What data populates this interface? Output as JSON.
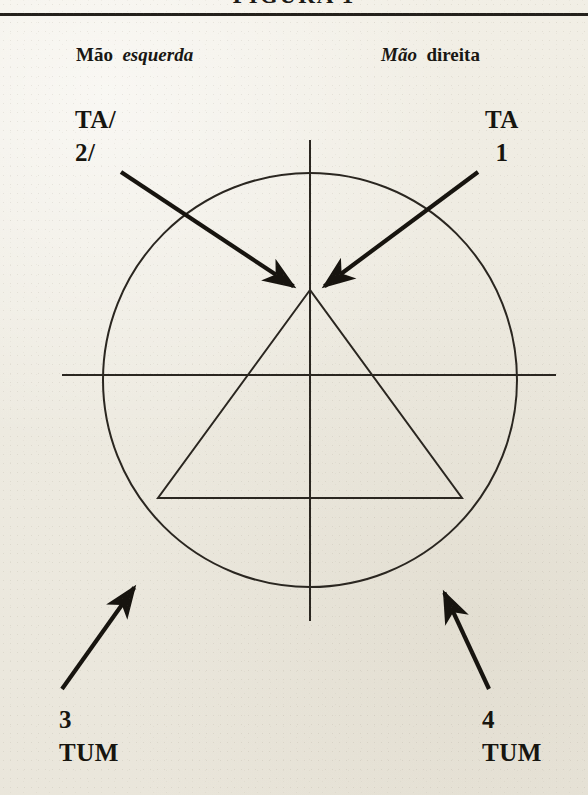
{
  "page": {
    "background_color": "#efece2",
    "ink_color": "#1b1812",
    "cut_off_title": "FIGURA 1"
  },
  "header": {
    "left_hand_label": {
      "word_upright": "Mão",
      "word_italic": "esquerda"
    },
    "right_hand_label": {
      "word_italic": "Mão",
      "word_upright": "direita"
    }
  },
  "annotations": [
    {
      "id": "ta-2",
      "line1": "TA/",
      "line2": "2/",
      "position": "top-left"
    },
    {
      "id": "ta-1",
      "line1": "TA",
      "line2": "1",
      "position": "top-right"
    },
    {
      "id": "tum-3",
      "line1": "3",
      "line2": "TUM",
      "position": "bottom-left"
    },
    {
      "id": "tum-4",
      "line1": "4",
      "line2": "TUM",
      "position": "bottom-right"
    }
  ],
  "figure": {
    "type": "geometric-diagram",
    "circle": {
      "cx": 310,
      "cy": 380,
      "r": 207,
      "stroke_width": 2
    },
    "vertical_axis": {
      "x": 310,
      "y1": 140,
      "y2": 621,
      "stroke_width": 2
    },
    "horizontal_axis": {
      "y": 375,
      "x1": 62,
      "x2": 556,
      "stroke_width": 2
    },
    "triangle": {
      "apex": [
        310,
        290
      ],
      "base_left": [
        158,
        498
      ],
      "base_right": [
        462,
        498
      ],
      "stroke_width": 2
    },
    "arrows": [
      {
        "id": "arrow-ta-2",
        "from": [
          121,
          172
        ],
        "to": [
          296,
          288
        ],
        "points_to": "triangle-apex",
        "label": "TA/ 2/"
      },
      {
        "id": "arrow-ta-1",
        "from": [
          478,
          172
        ],
        "to": [
          322,
          288
        ],
        "points_to": "triangle-apex",
        "label": "TA 1"
      },
      {
        "id": "arrow-tum-3",
        "from": [
          62,
          689
        ],
        "to": [
          136,
          585
        ],
        "points_to": "circle-lower-left",
        "label": "3 TUM"
      },
      {
        "id": "arrow-tum-4",
        "from": [
          489,
          689
        ],
        "to": [
          443,
          590
        ],
        "points_to": "circle-lower-right",
        "label": "4 TUM"
      }
    ]
  }
}
